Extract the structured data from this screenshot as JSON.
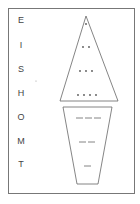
{
  "diagram": {
    "letters": [
      {
        "char": "E",
        "code": ".",
        "y": 22
      },
      {
        "char": "I",
        "code": "..",
        "y": 47
      },
      {
        "char": "S",
        "code": "...",
        "y": 71
      },
      {
        "char": "H",
        "code": "....",
        "y": 95
      },
      {
        "char": "O",
        "code": "---",
        "y": 119
      },
      {
        "char": "M",
        "code": "--",
        "y": 143
      },
      {
        "char": "T",
        "code": "-",
        "y": 166
      }
    ],
    "colors": {
      "line": "#666666",
      "text": "#444444",
      "border": "#777777"
    }
  }
}
